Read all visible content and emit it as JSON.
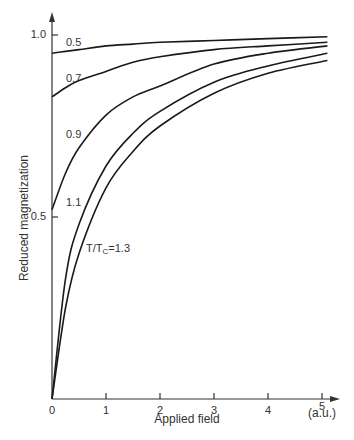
{
  "chart_data": {
    "type": "line",
    "title": "",
    "xlabel": "Applied field",
    "xunit": "(a.u.)",
    "ylabel": "Reduced magnetization",
    "xlim": [
      0,
      5.2
    ],
    "ylim": [
      0,
      1.05
    ],
    "x_ticks": [
      "0",
      "1",
      "2",
      "3",
      "4",
      "5"
    ],
    "y_ticks": [
      "0.5",
      "1.0"
    ],
    "grid": false,
    "legend": "inline curve labels",
    "x": [
      0,
      0.25,
      0.5,
      1,
      1.5,
      2,
      3,
      4,
      5.1
    ],
    "series": [
      {
        "name": "0.5",
        "label": "0.5",
        "values": [
          0.95,
          0.955,
          0.96,
          0.97,
          0.975,
          0.98,
          0.985,
          0.99,
          0.995
        ]
      },
      {
        "name": "0.7",
        "label": "0.7",
        "values": [
          0.83,
          0.855,
          0.875,
          0.9,
          0.925,
          0.94,
          0.96,
          0.97,
          0.98
        ]
      },
      {
        "name": "0.9",
        "label": "0.9",
        "values": [
          0.52,
          0.62,
          0.69,
          0.78,
          0.83,
          0.86,
          0.92,
          0.95,
          0.97
        ]
      },
      {
        "name": "1.1",
        "label": "1.1",
        "values": [
          0.0,
          0.33,
          0.48,
          0.64,
          0.73,
          0.79,
          0.87,
          0.915,
          0.95
        ]
      },
      {
        "name": "1.3",
        "label": "T/Tc=1.3",
        "values": [
          0.0,
          0.25,
          0.4,
          0.58,
          0.68,
          0.75,
          0.84,
          0.895,
          0.93
        ]
      }
    ],
    "annotations": [
      "0.5",
      "0.7",
      "0.9",
      "1.1",
      "T/Tc=1.3"
    ]
  },
  "labels": {
    "xlabel": "Applied field",
    "xunit": "(a.u.)",
    "ylabel": "Reduced magnetization",
    "y_tick_1": "1.0",
    "y_tick_05": "0.5",
    "x_ticks": [
      "0",
      "1",
      "2",
      "3",
      "4",
      "5"
    ],
    "curve_05": "0.5",
    "curve_07": "0.7",
    "curve_09": "0.9",
    "curve_11": "1.1",
    "curve_13_prefix": "T/T",
    "curve_13_sub": "C",
    "curve_13_suffix": "=1.3"
  },
  "colors": {
    "line": "#1a1a1a",
    "axis": "#333333",
    "background": "#ffffff"
  }
}
